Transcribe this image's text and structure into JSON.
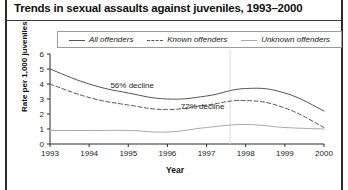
{
  "figure": {
    "title": "Trends in sexual assaults against juveniles, 1993–2000"
  },
  "legend": {
    "entries": [
      {
        "label": "All offenders",
        "style": "solid-dark",
        "color": "#555555"
      },
      {
        "label": "Known offenders",
        "style": "dashed-dark",
        "color": "#555555"
      },
      {
        "label": "Unknown offenders",
        "style": "solid-light",
        "color": "#a9a9a9"
      }
    ]
  },
  "chart_data": {
    "type": "line",
    "title": "Trends in sexual assaults against juveniles, 1993–2000",
    "xlabel": "Year",
    "ylabel": "Rate per 1,000 juveniles",
    "x": [
      1993,
      1994,
      1995,
      1996,
      1997,
      1998,
      1999,
      2000
    ],
    "xtick_labels": [
      "1993",
      "1994",
      "1995",
      "1996",
      "1997",
      "1998",
      "1999",
      "2000"
    ],
    "ytick_labels": [
      "0",
      "1",
      "2",
      "3",
      "4",
      "5",
      "6"
    ],
    "ylim": [
      0,
      6
    ],
    "yticks": [
      0,
      1,
      2,
      3,
      4,
      5,
      6
    ],
    "grid": false,
    "legend_position": "top",
    "series": [
      {
        "name": "All offenders",
        "values": [
          5.0,
          4.0,
          3.4,
          3.0,
          3.2,
          3.7,
          3.4,
          2.2
        ]
      },
      {
        "name": "Known offenders",
        "values": [
          4.0,
          3.1,
          2.6,
          2.3,
          2.6,
          2.9,
          2.4,
          1.1
        ]
      },
      {
        "name": "Unknown offenders",
        "values": [
          0.9,
          0.9,
          0.9,
          0.8,
          1.1,
          1.3,
          1.1,
          1.0
        ]
      }
    ],
    "annotations": [
      {
        "text": "56% decline",
        "x": 1995.1,
        "y": 3.75
      },
      {
        "text": "72% decline",
        "x": 1996.9,
        "y": 2.35
      }
    ]
  }
}
